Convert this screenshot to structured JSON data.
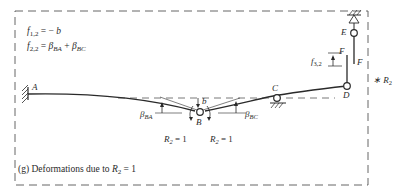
{
  "equations": {
    "f12": "f₁,₂ = − b",
    "f22": "f₂,₂ = βBA + βBC"
  },
  "nodes": {
    "A": "A",
    "B": "B",
    "C": "C",
    "D": "D",
    "E": "E",
    "F_top": "F",
    "F_right": "F"
  },
  "annotations": {
    "b": "b",
    "beta_ba": "β",
    "beta_ba_sub": "BA",
    "beta_bc": "β",
    "beta_bc_sub": "BC",
    "f32": "f",
    "f32_sub": "3,2",
    "r2_left": "R",
    "r2_left_sub": "2",
    "r2_left_val": " = 1",
    "r2_right": "R",
    "r2_right_sub": "2",
    "r2_right_val": " = 1",
    "star_r2": "∗ R",
    "star_r2_sub": "2"
  },
  "caption": {
    "prefix": "(g)  Deformations due to ",
    "var": "R",
    "sub": "2",
    "suffix": " = 1"
  },
  "colors": {
    "ink": "#2a2a2a",
    "dash": "#555555",
    "background": "#ffffff"
  }
}
